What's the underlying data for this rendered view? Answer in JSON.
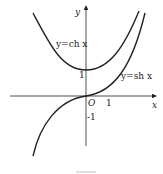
{
  "figure": {
    "axes": {
      "x_label": "x",
      "y_label": "y",
      "origin_label": "O"
    },
    "ticks": {
      "x_one": "1",
      "y_one": "1",
      "y_minus_one": "-1"
    },
    "curves": [
      {
        "name": "cosh",
        "label": "y=ch x"
      },
      {
        "name": "sinh",
        "label": "y=sh x"
      }
    ],
    "caption": "图"
  }
}
